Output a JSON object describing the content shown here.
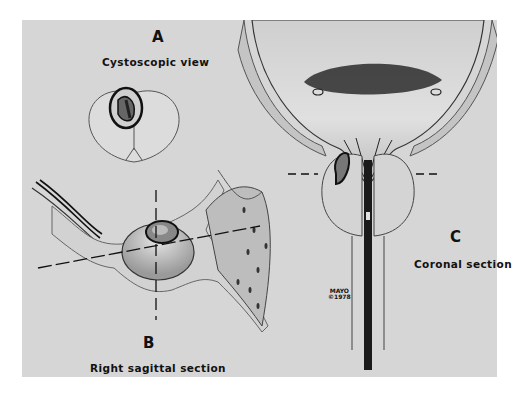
{
  "figure": {
    "panels": [
      {
        "id": "A",
        "letter": "A",
        "caption": "Cystoscopic view"
      },
      {
        "id": "B",
        "letter": "B",
        "caption": "Right sagittal section"
      },
      {
        "id": "C",
        "letter": "C",
        "caption": "Coronal section"
      }
    ],
    "watermark": {
      "line1": "MAYO",
      "line2": "©1978"
    },
    "colors": {
      "background": "#d6d6d6",
      "ink": "#111111",
      "page": "#ffffff"
    }
  }
}
